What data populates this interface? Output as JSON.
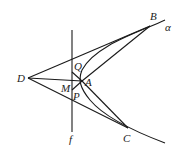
{
  "diagram": {
    "type": "geometry",
    "points": {
      "D": {
        "label": "D",
        "x": 28,
        "y": 78
      },
      "B": {
        "label": "B",
        "x": 150,
        "y": 26
      },
      "A": {
        "label": "A",
        "x": 82,
        "y": 81
      },
      "Q": {
        "label": "Q",
        "x": 72,
        "y": 72
      },
      "M": {
        "label": "M",
        "x": 72,
        "y": 83
      },
      "P": {
        "label": "P",
        "x": 72,
        "y": 90
      },
      "C": {
        "label": "C",
        "x": 128,
        "y": 128
      }
    },
    "labels": {
      "D": "D",
      "B": "B",
      "alpha": "α",
      "Q": "Q",
      "A": "A",
      "M": "M",
      "P": "P",
      "C": "C",
      "f": "f"
    },
    "lines": [
      {
        "name": "DB",
        "from": "D",
        "to": "B"
      },
      {
        "name": "DC",
        "from": "D",
        "to": "C"
      },
      {
        "name": "DA",
        "from": "D",
        "to": "A"
      },
      {
        "name": "BA",
        "from": "B",
        "to": "A"
      },
      {
        "name": "AC",
        "from": "A",
        "to": "C"
      },
      {
        "name": "QP",
        "from": "Q",
        "to": "P"
      },
      {
        "name": "f",
        "type": "vertical line"
      }
    ],
    "curves": [
      {
        "name": "alpha",
        "type": "parabola-like curve through B, A, C"
      }
    ]
  }
}
